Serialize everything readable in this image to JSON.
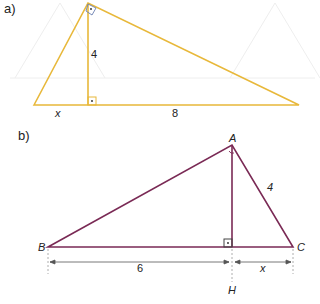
{
  "figure_a": {
    "label": "a)",
    "color": "#e8b83a",
    "altitude_label": "4",
    "left_segment_label": "x",
    "right_segment_label": "8"
  },
  "figure_b": {
    "label": "b)",
    "color": "#7a2a55",
    "vertices": {
      "A": "A",
      "B": "B",
      "C": "C",
      "H": "H"
    },
    "side_AC_label": "4",
    "segment_BH_label": "6",
    "segment_HC_label": "x"
  }
}
